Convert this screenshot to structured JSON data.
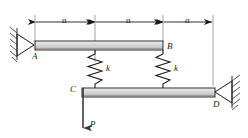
{
  "figure": {
    "type": "engineering-mechanics-diagram",
    "dimension_labels": [
      "a",
      "a",
      "a"
    ],
    "spring_labels": [
      "k",
      "k"
    ],
    "point_labels": {
      "a": "A",
      "b": "B",
      "c": "C",
      "d": "D"
    },
    "force_label": "P",
    "colors": {
      "bar_fill": "#d2d2d2",
      "bar_fill_light": "#ececec",
      "line": "#1a1a1a",
      "hatch": "#2b2b2b",
      "background": "#ffffff"
    },
    "geometry": {
      "dim_line_y": 22,
      "ext_x": [
        35,
        95,
        163,
        213
      ],
      "top_bar": {
        "x1": 35,
        "x2": 163,
        "y": 41,
        "h": 9
      },
      "bottom_bar": {
        "x1": 82,
        "x2": 215,
        "y": 88,
        "h": 9
      },
      "springs_x": [
        95,
        163
      ],
      "force_x": 82,
      "force_y_end": 128
    }
  }
}
